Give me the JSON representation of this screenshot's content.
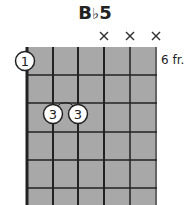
{
  "chord": {
    "root": "B",
    "accidental": "♭",
    "quality": "5",
    "name": "B♭5",
    "fret_label": "6 fr.",
    "start_fret": 6,
    "strings": 6,
    "frets_shown": 6,
    "muted_strings": [
      4,
      5,
      6
    ],
    "muted_symbol": "×",
    "fingers": [
      {
        "string": 1,
        "fret_row": 0,
        "finger": "1"
      },
      {
        "string": 2,
        "fret_row": 3,
        "finger": "3"
      },
      {
        "string": 3,
        "fret_row": 3,
        "finger": "3"
      }
    ],
    "slur": {
      "from_string": 2,
      "to_string": 3
    },
    "colors": {
      "fretboard": "#a8a8a8",
      "lines": "#222222",
      "finger_fill": "#ffffff",
      "text": "#222222"
    }
  }
}
